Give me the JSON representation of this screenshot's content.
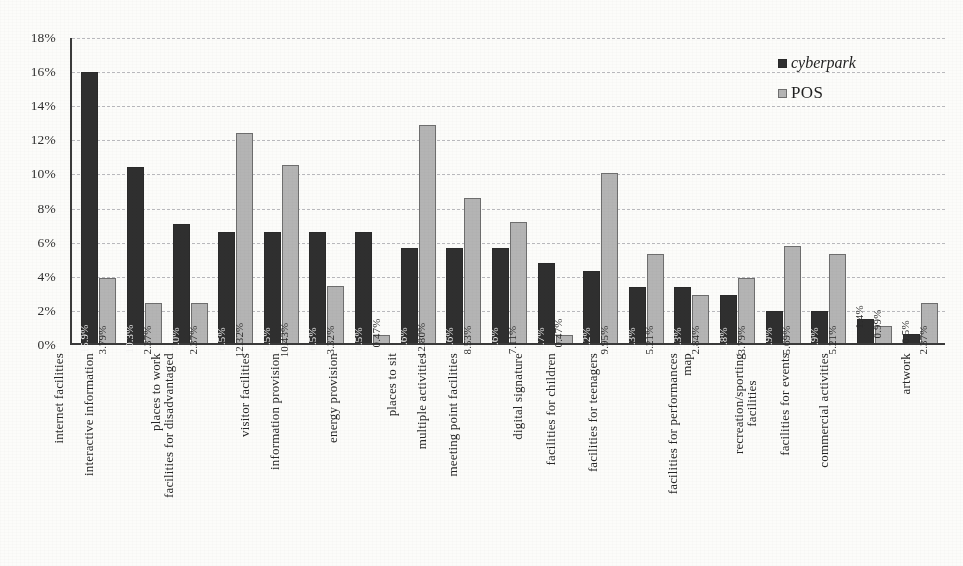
{
  "chart_data": {
    "type": "bar",
    "title": "",
    "subtitle": "",
    "xlabel": "",
    "ylabel": "",
    "ylim": [
      0,
      18
    ],
    "ytick_labels": [
      "0%",
      "2%",
      "4%",
      "6%",
      "8%",
      "10%",
      "12%",
      "14%",
      "16%",
      "18%"
    ],
    "ytick_values": [
      0,
      2,
      4,
      6,
      8,
      10,
      12,
      14,
      16,
      18
    ],
    "grid": true,
    "grid_style": "dashed-horizontal",
    "legend_position": "top-right",
    "value_labels_rotated": true,
    "categories": [
      "internet facilities",
      "interactive information",
      "places to work",
      "facilities for disadvantaged",
      "visitor facilities",
      "information provision",
      "energy provision",
      "places to sit",
      "multiple activities",
      "meeting point facilities",
      "digital signature",
      "facilities for children",
      "facilities for teenagers",
      "map",
      "facilities for performances",
      "recreation/sporting facilities",
      "facilities for events",
      "commercial activities",
      "artwork"
    ],
    "category_lines": [
      [
        "internet facilities"
      ],
      [
        "interactive information"
      ],
      [
        "places to work"
      ],
      [
        "facilities for disadvantaged"
      ],
      [
        "visitor facilities"
      ],
      [
        "information provision"
      ],
      [
        "energy provision"
      ],
      [
        "places to sit"
      ],
      [
        "multiple activities"
      ],
      [
        "meeting point facilities"
      ],
      [
        "digital signature"
      ],
      [
        "facilities for children"
      ],
      [
        "facilities for teenagers"
      ],
      [
        "map"
      ],
      [
        "facilities for performances"
      ],
      [
        "recreation/sporting",
        "facilities"
      ],
      [
        "facilities for events"
      ],
      [
        "commercial activities"
      ],
      [
        "artwork"
      ]
    ],
    "series": [
      {
        "name": "cyberpark",
        "color": "#2f2f2f",
        "values": [
          15.9,
          10.3,
          7.0,
          6.5,
          6.5,
          6.5,
          6.5,
          5.6,
          5.6,
          5.6,
          4.7,
          4.2,
          3.3,
          3.3,
          2.8,
          1.9,
          1.9,
          1.4,
          0.5
        ],
        "labels": [
          "15.9%",
          "10.3%",
          "7.0%",
          "6.5%",
          "6.5%",
          "6.5%",
          "6.5%",
          "5.6%",
          "5.6%",
          "5.6%",
          "4.7%",
          "4.2%",
          "3.3%",
          "3.3%",
          "2.8%",
          "1.9%",
          "1.9%",
          "1.4%",
          "0.5%"
        ]
      },
      {
        "name": "POS",
        "color": "#b4b4b4",
        "values": [
          3.79,
          2.37,
          2.37,
          12.32,
          10.43,
          3.32,
          0.47,
          12.8,
          8.53,
          7.11,
          0.47,
          9.95,
          5.21,
          2.84,
          3.79,
          5.69,
          5.21,
          0.99,
          2.37
        ],
        "labels": [
          "3.79%",
          "2.37%",
          "2.37%",
          "12.32%",
          "10.43%",
          "3.32%",
          "0.47%",
          "12.80%",
          "8.53%",
          "7.11%",
          "0.47%",
          "9.95%",
          "5.21%",
          "2.84%",
          "3.79%",
          "5.69%",
          "5.21%",
          "0.99%",
          "2.37%"
        ]
      }
    ]
  },
  "legend": {
    "entries": [
      {
        "label": "cyberpark"
      },
      {
        "label": "POS"
      }
    ]
  },
  "colors": {
    "series_cyberpark": "#2f2f2f",
    "series_pos": "#b4b4b4",
    "axis": "#3a3a3a",
    "grid": "#b9b9bd",
    "background": "#fcfcfa"
  }
}
